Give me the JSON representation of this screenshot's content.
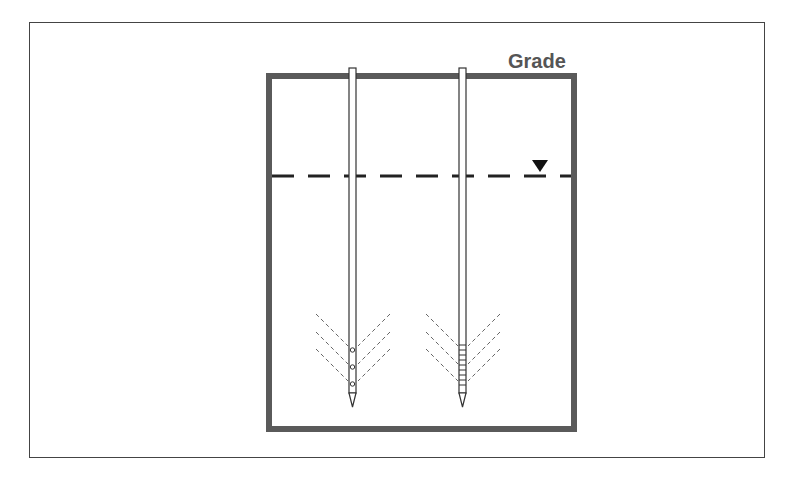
{
  "diagram": {
    "title": "",
    "grade_label": "Grade",
    "elements": [
      {
        "name": "excavation-box",
        "type": "rectangle"
      },
      {
        "name": "water-table",
        "type": "dashed-line",
        "symbol": "inverted-triangle"
      },
      {
        "name": "well-left",
        "screen": "perforated holes (3)"
      },
      {
        "name": "well-right",
        "screen": "slotted screen"
      }
    ],
    "colors": {
      "box": "#555555",
      "line": "#222222",
      "frame": "#444444"
    }
  }
}
